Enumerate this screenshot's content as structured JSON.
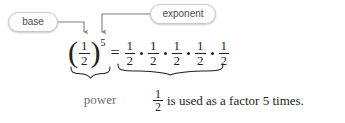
{
  "diagram": {
    "callouts": [
      {
        "id": "base",
        "label": "base",
        "points_to": "fraction-one-half"
      },
      {
        "id": "exponent",
        "label": "exponent",
        "points_to": "superscript-five"
      }
    ],
    "expression": {
      "base": {
        "numerator": "1",
        "denominator": "2"
      },
      "exponent": "5",
      "equals": "=",
      "multiplication_dot": "•",
      "factors": [
        {
          "numerator": "1",
          "denominator": "2"
        },
        {
          "numerator": "1",
          "denominator": "2"
        },
        {
          "numerator": "1",
          "denominator": "2"
        },
        {
          "numerator": "1",
          "denominator": "2"
        },
        {
          "numerator": "1",
          "denominator": "2"
        }
      ]
    },
    "brace_labels": {
      "power": "power",
      "caption_fraction": {
        "numerator": "1",
        "denominator": "2"
      },
      "caption_text": "is used as a factor 5 times."
    },
    "colors": {
      "ink": "#231f20",
      "muted": "#6e6e6e",
      "pill_border": "#c9c9c9",
      "connector": "#7f7f7f",
      "background": "#ffffff"
    }
  }
}
